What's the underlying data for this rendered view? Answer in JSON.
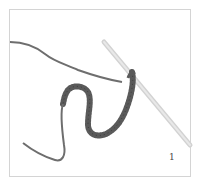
{
  "figure": {
    "step_number": "1",
    "colors": {
      "frame_border": "#d4d4d4",
      "yarn": "#6e6e6e",
      "chain": "#5a5a5a",
      "hook": "#cfcfcf",
      "label": "#444444"
    }
  }
}
